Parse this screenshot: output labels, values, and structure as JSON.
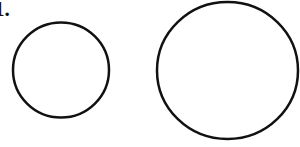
{
  "figure": {
    "label": "1.",
    "stroke_color": "#111111",
    "background_color": "#ffffff",
    "shapes": [
      {
        "name": "small-circle",
        "type": "ellipse",
        "cx": 61,
        "cy": 70,
        "rx": 48,
        "ry": 47.5,
        "stroke_width": 2.5
      },
      {
        "name": "large-circle",
        "type": "ellipse",
        "cx": 227.5,
        "cy": 70.5,
        "rx": 70.5,
        "ry": 68.5,
        "stroke_width": 2.5
      }
    ]
  }
}
